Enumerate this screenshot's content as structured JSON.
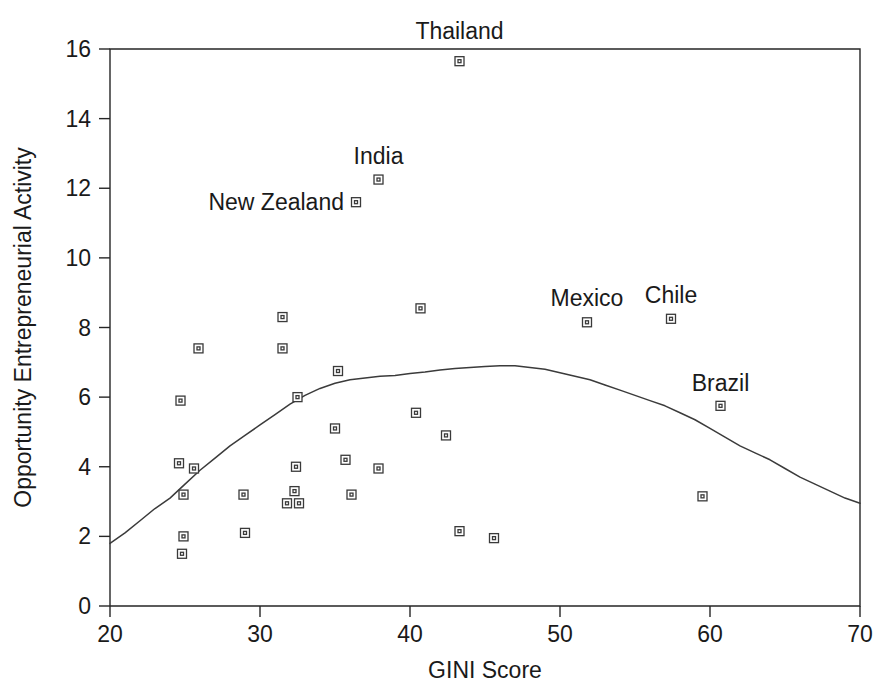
{
  "chart_data": {
    "type": "scatter",
    "title": "",
    "xlabel": "GINI Score",
    "ylabel": "Opportunity Entrepreneurial Activity",
    "xlim": [
      20,
      70
    ],
    "ylim": [
      0,
      16
    ],
    "xticks": [
      20,
      30,
      40,
      50,
      60,
      70
    ],
    "yticks": [
      0,
      2,
      4,
      6,
      8,
      10,
      12,
      14,
      16
    ],
    "grid": false,
    "legend": null,
    "marker_style": "open-square",
    "series": [
      {
        "name": "Countries",
        "points": [
          {
            "x": 24.7,
            "y": 5.9,
            "label": ""
          },
          {
            "x": 24.6,
            "y": 4.1,
            "label": ""
          },
          {
            "x": 25.6,
            "y": 3.95,
            "label": ""
          },
          {
            "x": 24.9,
            "y": 3.2,
            "label": ""
          },
          {
            "x": 24.9,
            "y": 2.0,
            "label": ""
          },
          {
            "x": 24.8,
            "y": 1.5,
            "label": ""
          },
          {
            "x": 25.9,
            "y": 7.4,
            "label": ""
          },
          {
            "x": 28.9,
            "y": 3.2,
            "label": ""
          },
          {
            "x": 29.0,
            "y": 2.1,
            "label": ""
          },
          {
            "x": 31.5,
            "y": 8.3,
            "label": ""
          },
          {
            "x": 31.5,
            "y": 7.4,
            "label": ""
          },
          {
            "x": 32.5,
            "y": 6.0,
            "label": ""
          },
          {
            "x": 32.4,
            "y": 4.0,
            "label": ""
          },
          {
            "x": 32.3,
            "y": 3.3,
            "label": ""
          },
          {
            "x": 31.8,
            "y": 2.95,
            "label": ""
          },
          {
            "x": 32.6,
            "y": 2.95,
            "label": ""
          },
          {
            "x": 35.2,
            "y": 6.75,
            "label": ""
          },
          {
            "x": 35.0,
            "y": 5.1,
            "label": ""
          },
          {
            "x": 35.7,
            "y": 4.2,
            "label": ""
          },
          {
            "x": 36.1,
            "y": 3.2,
            "label": ""
          },
          {
            "x": 37.9,
            "y": 3.95,
            "label": ""
          },
          {
            "x": 40.4,
            "y": 5.55,
            "label": ""
          },
          {
            "x": 40.7,
            "y": 8.55,
            "label": ""
          },
          {
            "x": 42.4,
            "y": 4.9,
            "label": ""
          },
          {
            "x": 43.3,
            "y": 2.15,
            "label": ""
          },
          {
            "x": 45.6,
            "y": 1.95,
            "label": ""
          },
          {
            "x": 59.5,
            "y": 3.15,
            "label": ""
          },
          {
            "x": 43.3,
            "y": 15.65,
            "label": "Thailand"
          },
          {
            "x": 37.9,
            "y": 12.25,
            "label": "India"
          },
          {
            "x": 36.4,
            "y": 11.6,
            "label": "New Zealand"
          },
          {
            "x": 51.8,
            "y": 8.15,
            "label": "Mexico"
          },
          {
            "x": 57.4,
            "y": 8.25,
            "label": "Chile"
          },
          {
            "x": 60.7,
            "y": 5.75,
            "label": "Brazil"
          }
        ]
      }
    ],
    "fit_curve": {
      "name": "quadratic trend line",
      "points": [
        {
          "x": 20.0,
          "y": 1.8
        },
        {
          "x": 21.0,
          "y": 2.1
        },
        {
          "x": 22.0,
          "y": 2.45
        },
        {
          "x": 23.0,
          "y": 2.8
        },
        {
          "x": 24.0,
          "y": 3.1
        },
        {
          "x": 25.0,
          "y": 3.5
        },
        {
          "x": 26.0,
          "y": 3.9
        },
        {
          "x": 27.0,
          "y": 4.25
        },
        {
          "x": 28.0,
          "y": 4.6
        },
        {
          "x": 29.0,
          "y": 4.9
        },
        {
          "x": 30.0,
          "y": 5.2
        },
        {
          "x": 31.0,
          "y": 5.5
        },
        {
          "x": 32.0,
          "y": 5.8
        },
        {
          "x": 33.0,
          "y": 6.05
        },
        {
          "x": 34.0,
          "y": 6.25
        },
        {
          "x": 35.0,
          "y": 6.4
        },
        {
          "x": 36.0,
          "y": 6.5
        },
        {
          "x": 37.0,
          "y": 6.55
        },
        {
          "x": 38.0,
          "y": 6.6
        },
        {
          "x": 39.0,
          "y": 6.62
        },
        {
          "x": 40.0,
          "y": 6.68
        },
        {
          "x": 41.0,
          "y": 6.72
        },
        {
          "x": 42.0,
          "y": 6.78
        },
        {
          "x": 43.0,
          "y": 6.82
        },
        {
          "x": 44.0,
          "y": 6.85
        },
        {
          "x": 45.0,
          "y": 6.88
        },
        {
          "x": 46.0,
          "y": 6.9
        },
        {
          "x": 47.0,
          "y": 6.9
        },
        {
          "x": 48.0,
          "y": 6.85
        },
        {
          "x": 49.0,
          "y": 6.8
        },
        {
          "x": 50.0,
          "y": 6.7
        },
        {
          "x": 51.0,
          "y": 6.6
        },
        {
          "x": 52.0,
          "y": 6.5
        },
        {
          "x": 53.0,
          "y": 6.35
        },
        {
          "x": 54.0,
          "y": 6.2
        },
        {
          "x": 55.0,
          "y": 6.05
        },
        {
          "x": 56.0,
          "y": 5.9
        },
        {
          "x": 57.0,
          "y": 5.75
        },
        {
          "x": 58.0,
          "y": 5.55
        },
        {
          "x": 59.0,
          "y": 5.35
        },
        {
          "x": 60.0,
          "y": 5.1
        },
        {
          "x": 61.0,
          "y": 4.85
        },
        {
          "x": 62.0,
          "y": 4.6
        },
        {
          "x": 63.0,
          "y": 4.4
        },
        {
          "x": 64.0,
          "y": 4.2
        },
        {
          "x": 65.0,
          "y": 3.95
        },
        {
          "x": 66.0,
          "y": 3.7
        },
        {
          "x": 67.0,
          "y": 3.5
        },
        {
          "x": 68.0,
          "y": 3.3
        },
        {
          "x": 69.0,
          "y": 3.1
        },
        {
          "x": 70.0,
          "y": 2.95
        }
      ]
    },
    "colors": {
      "axis": "#262626",
      "marker_stroke": "#3a3a3a",
      "marker_fill": "#ffffff",
      "curve": "#3b3b3b",
      "text": "#1a1a1a",
      "background": "#ffffff"
    }
  },
  "labels": {
    "x_axis_title": "GINI Score",
    "y_axis_title": "Opportunity Entrepreneurial Activity",
    "annotations": [
      "Thailand",
      "India",
      "New Zealand",
      "Mexico",
      "Chile",
      "Brazil"
    ]
  }
}
